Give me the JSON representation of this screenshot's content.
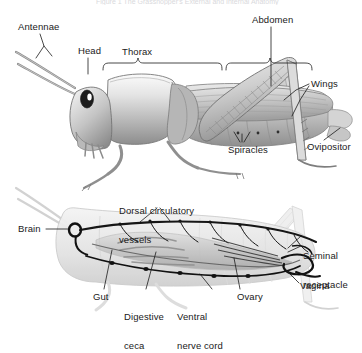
{
  "figure": {
    "title_partial": "Figure 1 The Grasshopper's External and Internal Anatomy",
    "background_color": "#ffffff",
    "ink_color": "#1a1a1a",
    "organism": "grasshopper",
    "panels": [
      {
        "id": "external",
        "name": "external-anatomy-panel",
        "description": "Lateral view of a grasshopper showing external body regions"
      },
      {
        "id": "internal",
        "name": "internal-anatomy-panel",
        "description": "Ghosted lateral view of a grasshopper showing internal organ systems"
      }
    ]
  },
  "labels_external": [
    {
      "id": "antennae",
      "text": "Antennae",
      "x": 18,
      "y": 22
    },
    {
      "id": "head",
      "text": "Head",
      "x": 78,
      "y": 46
    },
    {
      "id": "thorax",
      "text": "Thorax",
      "x": 122,
      "y": 47
    },
    {
      "id": "abdomen",
      "text": "Abdomen",
      "x": 252,
      "y": 15
    },
    {
      "id": "wings",
      "text": "Wings",
      "x": 311,
      "y": 79
    },
    {
      "id": "spiracles",
      "text": "Spiracles",
      "x": 228,
      "y": 145
    },
    {
      "id": "ovipositor",
      "text": "Ovipositor",
      "x": 307,
      "y": 142
    }
  ],
  "labels_internal": [
    {
      "id": "dorsal-circulatory-vessels",
      "line1": "Dorsal circulatory",
      "line2": "vessels",
      "x": 119,
      "y": 186
    },
    {
      "id": "brain",
      "line1": "Brain",
      "line2": "",
      "x": 18,
      "y": 224
    },
    {
      "id": "seminal-receptacle",
      "line1": "Seminal",
      "line2": "receptacle",
      "x": 303,
      "y": 231
    },
    {
      "id": "vagina",
      "line1": "Vagina",
      "line2": "",
      "x": 300,
      "y": 281
    },
    {
      "id": "gut",
      "line1": "Gut",
      "line2": "",
      "x": 93,
      "y": 292
    },
    {
      "id": "digestive-ceca",
      "line1": "Digestive",
      "line2": "ceca",
      "x": 124,
      "y": 292
    },
    {
      "id": "ventral-nerve-cord",
      "line1": "Ventral",
      "line2": "nerve cord",
      "x": 177,
      "y": 292
    },
    {
      "id": "ovary",
      "line1": "Ovary",
      "line2": "",
      "x": 237,
      "y": 292
    }
  ]
}
